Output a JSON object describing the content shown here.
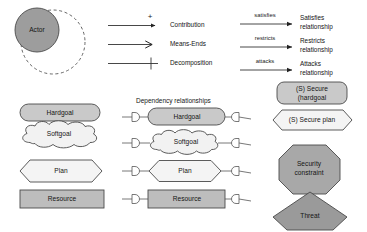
{
  "diagram": {
    "title": "",
    "colors": {
      "actor_fill": "#9d9d9d",
      "hardgoal_fill": "#c9c9c9",
      "softgoal_fill": "#f2f2f2",
      "plan_fill": "#f4f4f4",
      "resource_fill": "#bdbdbd",
      "secure_hardgoal_fill": "#c9c9c9",
      "secure_plan_fill": "#f4f4f4",
      "security_constraint_fill": "#a8a8a8",
      "threat_fill": "#9a9a9a",
      "stroke": "#4a4a4a",
      "line": "#333333",
      "background": "#ffffff"
    },
    "actor": {
      "label": "Actor"
    },
    "link_legend": {
      "items": [
        {
          "label": "Contribution",
          "sign": "+",
          "arrow": "filled-small",
          "icon": "contribution-link-icon"
        },
        {
          "label": "Means-Ends",
          "sign": "",
          "arrow": "open-large",
          "icon": "means-ends-link-icon"
        },
        {
          "label": "Decomposition",
          "sign": "",
          "arrow": "tick",
          "icon": "decomposition-link-icon"
        }
      ]
    },
    "relationship_legend": {
      "items": [
        {
          "edge_label": "satisfies",
          "name_line1": "Satisfies",
          "name_line2": "relationship",
          "icon": "satisfies-arrow-icon"
        },
        {
          "edge_label": "restricts",
          "name_line1": "Restricts",
          "name_line2": "relationship",
          "icon": "restricts-arrow-icon"
        },
        {
          "edge_label": "attacks",
          "name_line1": "Attacks",
          "name_line2": "relationship",
          "icon": "attacks-arrow-icon"
        }
      ]
    },
    "element_shapes": {
      "items": [
        {
          "label": "Hardgoal",
          "shape": "rounded-rectangle"
        },
        {
          "label": "Softgoal",
          "shape": "cloud"
        },
        {
          "label": "Plan",
          "shape": "hexagon"
        },
        {
          "label": "Resource",
          "shape": "rectangle"
        }
      ]
    },
    "dependency_section": {
      "title": "Dependency relationships",
      "items": [
        {
          "label": "Hardgoal",
          "shape": "rounded-rectangle"
        },
        {
          "label": "Softgoal",
          "shape": "cloud"
        },
        {
          "label": "Plan",
          "shape": "hexagon"
        },
        {
          "label": "Resource",
          "shape": "rectangle"
        }
      ]
    },
    "security_shapes": {
      "items": [
        {
          "label_line1": "(S) Secure",
          "label_line2": "(hardgoal",
          "shape": "rounded-rectangle",
          "name": "secure-hardgoal"
        },
        {
          "label_line1": "(S) Secure plan",
          "label_line2": "",
          "shape": "hexagon",
          "name": "secure-plan"
        },
        {
          "label_line1": "Security",
          "label_line2": "constraint",
          "shape": "octagon",
          "name": "security-constraint"
        },
        {
          "label_line1": "Threat",
          "label_line2": "",
          "shape": "pentagon",
          "name": "threat"
        }
      ]
    }
  }
}
